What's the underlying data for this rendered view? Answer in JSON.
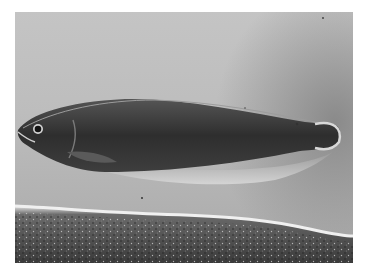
{
  "image": {
    "description": "Black-and-white photograph of an elongated knifefish swimming above a sandy bottom",
    "subject": "fish",
    "colors": {
      "background_water": "#bfbfbf",
      "fish_body": "#3a3a3a",
      "fish_belly_fin": "#d0d0d0",
      "sand_dark": "#3c3c3c",
      "sand_light": "#e2e2e2"
    }
  }
}
